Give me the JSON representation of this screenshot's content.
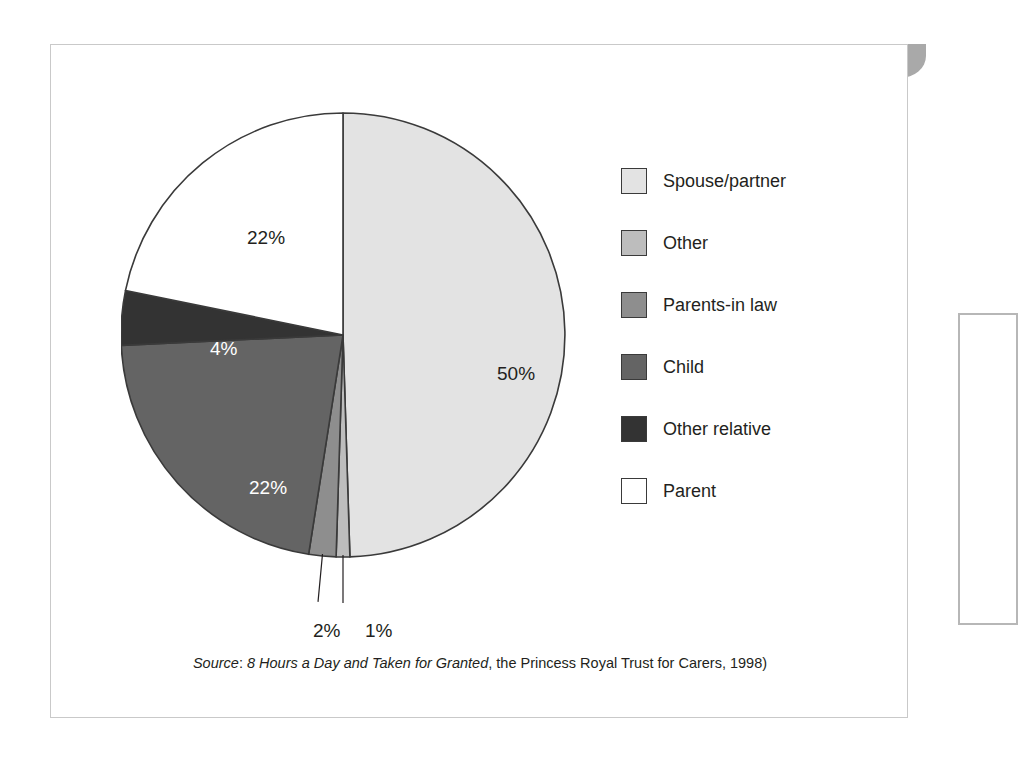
{
  "figure": {
    "number": "Figure 2.25",
    "title": "Relationship to cared for",
    "header_bg": "#a9a9a9",
    "header_text_color": "#ffffff"
  },
  "source": {
    "prefix": "Source",
    "separator": ": ",
    "title": "8 Hours a Day and Taken for Granted",
    "rest": ", the Princess Royal Trust for Carers, 1998)"
  },
  "legend": {
    "items": [
      {
        "label": "Spouse/partner",
        "color": "#e3e3e3"
      },
      {
        "label": "Other",
        "color": "#bdbdbd"
      },
      {
        "label": "Parents-in law",
        "color": "#8e8e8e"
      },
      {
        "label": "Child",
        "color": "#646464"
      },
      {
        "label": "Other relative",
        "color": "#333333"
      },
      {
        "label": "Parent",
        "color": "#ffffff"
      }
    ]
  },
  "labels": {
    "spouse": "50%",
    "parent": "22%",
    "child": "22%",
    "other_relative": "4%",
    "parents_in_law": "2%",
    "other": "1%"
  },
  "chart_data": {
    "type": "pie",
    "title": "Relationship to cared for",
    "subtitle": "",
    "xlabel": "",
    "ylabel": "",
    "units": "percent",
    "start_angle_deg": 0,
    "direction": "clockwise",
    "legend_position": "right",
    "grid": false,
    "categories": [
      "Spouse/partner",
      "Other",
      "Parents-in law",
      "Child",
      "Other relative",
      "Parent"
    ],
    "values": [
      50,
      1,
      2,
      22,
      4,
      22
    ],
    "labels": [
      "50%",
      "1%",
      "2%",
      "22%",
      "4%",
      "22%"
    ],
    "colors": [
      "#e3e3e3",
      "#bdbdbd",
      "#8e8e8e",
      "#646464",
      "#333333",
      "#ffffff"
    ],
    "label_text_colors": [
      "#231f20",
      "#231f20",
      "#231f20",
      "#ffffff",
      "#ffffff",
      "#231f20"
    ],
    "leader_lines": [
      "Parents-in law",
      "Other"
    ],
    "slice_border_color": "#3a3a3a",
    "total": 101,
    "source": "8 Hours a Day and Taken for Granted, the Princess Royal Trust for Carers, 1998)"
  }
}
